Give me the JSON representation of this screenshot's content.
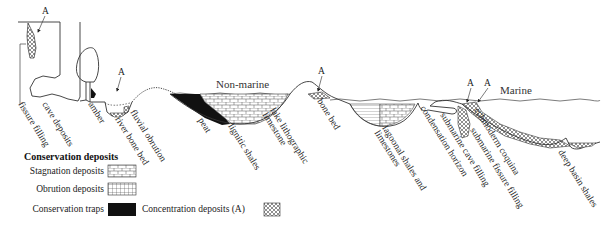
{
  "diagram": {
    "environments": {
      "non_marine": "Non-marine",
      "marine": "Marine"
    },
    "concentration_marker": "A",
    "site_labels": [
      {
        "id": "fissure-filling",
        "text": "fissure filling"
      },
      {
        "id": "cave-deposits",
        "text": "cave deposits"
      },
      {
        "id": "amber",
        "text": "amber"
      },
      {
        "id": "river-bone-bed",
        "text": "river bone bed"
      },
      {
        "id": "fluvial-obrution",
        "text": "fluvial obrution"
      },
      {
        "id": "peat",
        "text": "peat"
      },
      {
        "id": "lignitic-shales",
        "text": "lignitic shales"
      },
      {
        "id": "lake-lithographic-limestone",
        "line1": "lake lithographic",
        "line2": "limestone"
      },
      {
        "id": "bone-bed",
        "text": "bone bed"
      },
      {
        "id": "lagoonal-shales-and-limestones",
        "line1": "lagoonal shales and",
        "line2": "limestones"
      },
      {
        "id": "condensation-horizon",
        "text": "condensation horizon"
      },
      {
        "id": "submarine-cave-filling",
        "text": "submarine cave filling"
      },
      {
        "id": "submarine-fissure-filling",
        "text": "submarine fissure filling"
      },
      {
        "id": "echinoderm-coquina",
        "text": "echinoderm coquina"
      },
      {
        "id": "deep-basin-shales",
        "text": "deep basin shales"
      }
    ]
  },
  "legend": {
    "title": "Conservation deposits",
    "items": [
      {
        "label": "Stagnation deposits",
        "pattern": "brick-lines"
      },
      {
        "label": "Obrution deposits",
        "pattern": "grid"
      },
      {
        "label": "Conservation traps",
        "pattern": "solid-black"
      },
      {
        "label": "Concentration deposits (A)",
        "pattern": "crosshatch"
      }
    ]
  },
  "colors": {
    "ink": "#222222",
    "fill_black": "#111111",
    "background": "#ffffff"
  }
}
